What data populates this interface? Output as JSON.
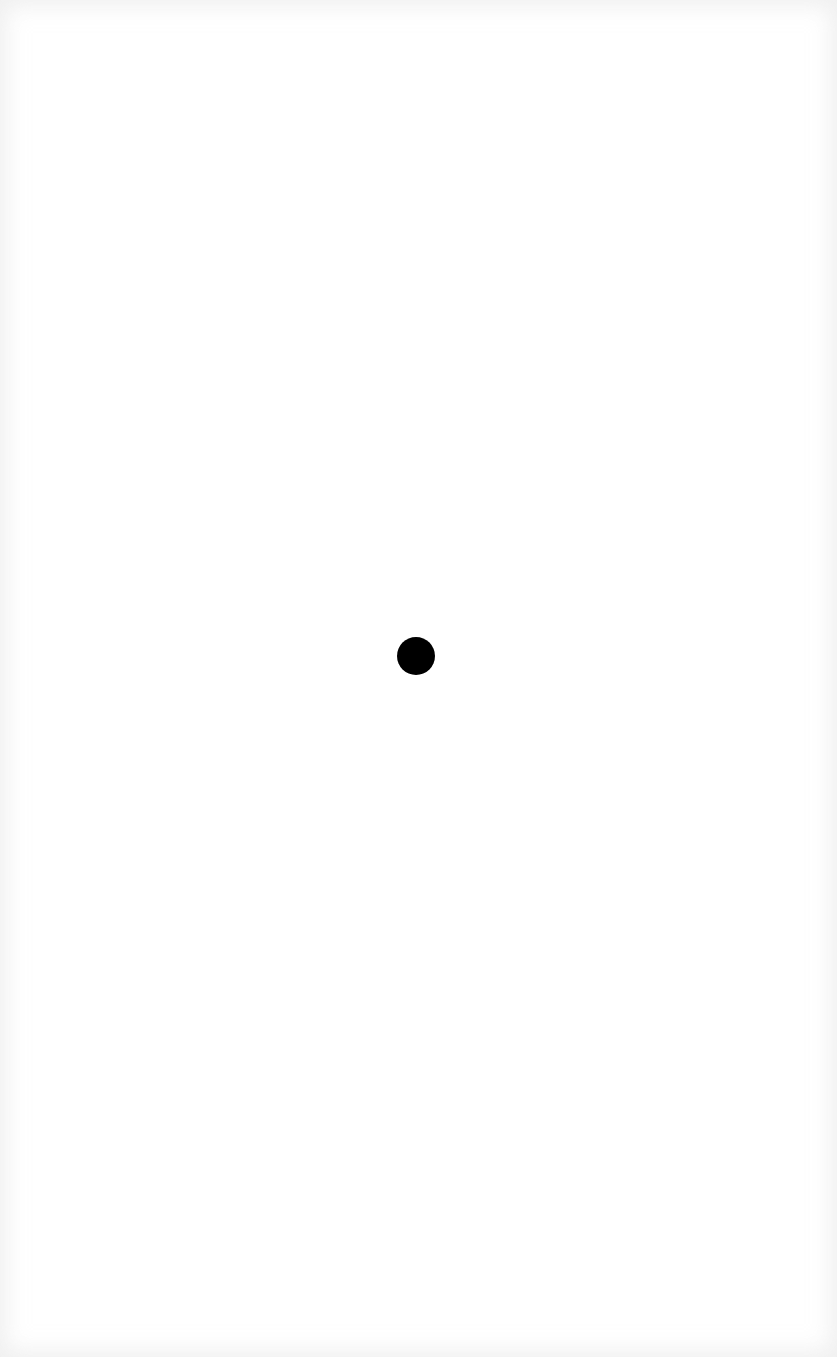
{
  "canvas": {
    "width": 837,
    "height": 1357,
    "background_color": "#ffffff",
    "edge_tint": "#ececec"
  },
  "marker": {
    "shape": "circle",
    "color": "#000000",
    "center_x": 416,
    "center_y": 656,
    "diameter": 38
  }
}
